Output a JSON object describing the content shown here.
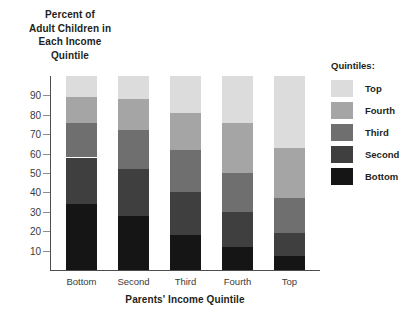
{
  "chart_data": {
    "type": "bar",
    "stacked": true,
    "title": "Percent of Adult Children in Each Income Quintile",
    "title_lines": [
      "Percent of",
      "Adult Children in",
      "Each Income",
      "Quintile"
    ],
    "xlabel": "Parents' Income Quintile",
    "ylabel": "",
    "categories": [
      "Bottom",
      "Second",
      "Third",
      "Fourth",
      "Top"
    ],
    "ylim": [
      0,
      100
    ],
    "yticks": [
      10,
      20,
      30,
      40,
      50,
      60,
      70,
      80,
      90
    ],
    "grid": false,
    "legend_title": "Quintiles:",
    "legend_position": "right",
    "legend_order": [
      "Top",
      "Fourth",
      "Third",
      "Second",
      "Bottom"
    ],
    "series": [
      {
        "name": "Bottom",
        "color": "#151515",
        "values": [
          34,
          28,
          18,
          12,
          7
        ]
      },
      {
        "name": "Second",
        "color": "#3f3f3f",
        "values": [
          24,
          24,
          22,
          18,
          12
        ]
      },
      {
        "name": "Third",
        "color": "#6f6f6f",
        "values": [
          18,
          20,
          22,
          20,
          18
        ]
      },
      {
        "name": "Fourth",
        "color": "#a5a5a5",
        "values": [
          13,
          16,
          19,
          26,
          26
        ]
      },
      {
        "name": "Top",
        "color": "#dcdcdc",
        "values": [
          11,
          12,
          19,
          24,
          37
        ]
      }
    ],
    "cumulative_tops": [
      [
        34,
        58,
        76,
        89,
        100
      ],
      [
        28,
        52,
        72,
        88,
        100
      ],
      [
        18,
        40,
        62,
        81,
        100
      ],
      [
        12,
        30,
        50,
        76,
        100
      ],
      [
        7,
        19,
        37,
        63,
        100
      ]
    ]
  },
  "colors": {
    "axis": "#4d4d4d",
    "tick": "#8c8c8c",
    "text": "#231f20",
    "background": "#ffffff"
  }
}
